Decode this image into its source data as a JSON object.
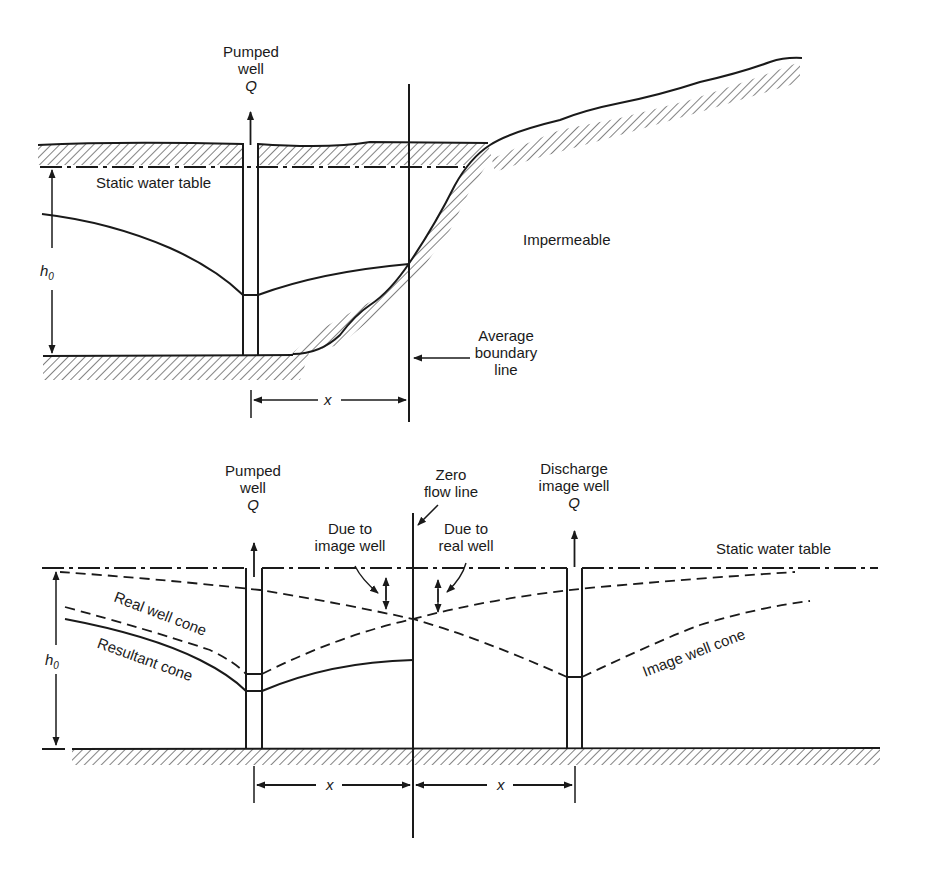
{
  "top_panel": {
    "pumped_well": {
      "line1": "Pumped",
      "line2": "well",
      "q": "Q"
    },
    "static_water_table": "Static water table",
    "impermeable": "Impermeable",
    "h0": {
      "h": "h",
      "sub": "0"
    },
    "boundary": {
      "line1": "Average",
      "line2": "boundary",
      "line3": "line"
    },
    "x": "x"
  },
  "bottom_panel": {
    "pumped_well": {
      "line1": "Pumped",
      "line2": "well",
      "q": "Q"
    },
    "zero_flow": {
      "line1": "Zero",
      "line2": "flow line"
    },
    "discharge_image_well": {
      "line1": "Discharge",
      "line2": "image well",
      "q": "Q"
    },
    "due_to_image_well": {
      "line1": "Due to",
      "line2": "image well"
    },
    "due_to_real_well": {
      "line1": "Due to",
      "line2": "real well"
    },
    "static_water_table": "Static water table",
    "real_well_cone": "Real well cone",
    "resultant_cone": "Resultant cone",
    "image_well_cone": "Image well cone",
    "h0": {
      "h": "h",
      "sub": "0"
    },
    "x_left": "x",
    "x_right": "x"
  },
  "colors": {
    "ink": "#1a1a1a",
    "background": "#ffffff"
  }
}
